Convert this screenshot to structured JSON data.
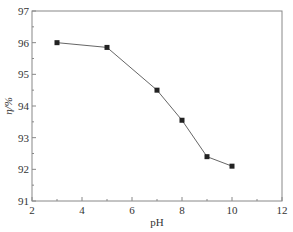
{
  "chart_data": {
    "type": "line",
    "title": "",
    "xlabel": "pH",
    "ylabel": "η/%",
    "xlim": [
      2,
      12
    ],
    "ylim": [
      91,
      97
    ],
    "x_ticks": [
      2,
      4,
      6,
      8,
      10,
      12
    ],
    "y_ticks": [
      91,
      92,
      93,
      94,
      95,
      96,
      97
    ],
    "grid": false,
    "legend": null,
    "marker": "square",
    "series": [
      {
        "name": "η",
        "x": [
          3,
          5,
          7,
          8,
          9,
          10
        ],
        "values": [
          96.0,
          95.85,
          94.5,
          93.55,
          92.4,
          92.1
        ]
      }
    ]
  },
  "colors": {
    "line": "#666666",
    "marker": "#222222",
    "axis": "#888888",
    "text": "#333333"
  }
}
